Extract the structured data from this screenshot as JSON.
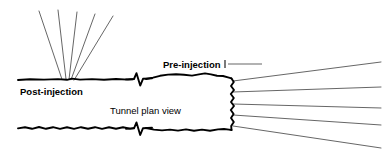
{
  "figure": {
    "title": "Tunnel plan view",
    "background_color": "#ffffff",
    "ink_color": "#000000",
    "bolt_color": "#555555",
    "leader_color": "#666666",
    "width": 387,
    "height": 154
  },
  "labels": {
    "post_injection": "Post-injection",
    "pre_injection": "Pre-injection",
    "plan_view": "Tunnel plan view"
  },
  "label_positions": {
    "post_injection": {
      "x": 20,
      "y": 95
    },
    "pre_injection": {
      "x": 163,
      "y": 68
    },
    "plan_view": {
      "x": 110,
      "y": 114
    }
  },
  "leader": {
    "tick_x": 225,
    "tick_y_top": 60,
    "tick_y_bottom": 68,
    "line_x_start": 228,
    "line_x_end": 262,
    "line_y": 64
  },
  "tunnel": {
    "top_wall_left": "M 18 80 L 30 79.2 L 44 79.6 L 58 79.1 L 67 79.8 L 72 78.6 L 80 79.6 L 92 79.1 L 104 79.7 L 116 79.0 L 128 79.6 L 133 79.2",
    "top_wall_right": "M 146 79.0 L 153 77.6 L 160 75.8 L 168 74.6 L 176 74.2 L 184 74.8 L 192 75.6 L 199 74.4 L 205 73.4 L 211 74.4 L 217 75.8 L 223 76.0 L 228 77.4 L 231.5 78.4",
    "bottom_wall_left": "M 18 128.4 L 25 127.2 L 32 128.8 L 39 127.0 L 46 128.8 L 53 127.2 L 60 128.9 L 67 127.3 L 74 128.9 L 81 127.2 L 88 128.8 L 95 127.2 L 102 128.9 L 109 127.3 L 116 128.8 L 123 127.3 L 130 128.6 L 134 128.0",
    "bottom_wall_right": "M 146 128.0 L 154 129.6 L 162 130.4 L 170 129.6 L 178 130.6 L 186 129.4 L 194 130.8 L 202 129.6 L 210 130.8 L 218 129.4 L 224 129.0 L 229 129.6 L 231.5 130.0",
    "face": "M 231.5 78.4 L 233.8 82 L 231.0 86 L 234.0 90 L 230.8 94 L 233.8 98 L 231.0 102 L 234.0 106 L 230.8 110 L 233.6 114 L 231.0 118 L 233.8 122 L 231.2 126 L 231.5 130.0",
    "break_top": "M 126 79.4 L 134 79.0 L 136.5 73.2 L 140.2 85.6 L 143.0 78.8 L 152 78.4",
    "break_bottom": "M 126 128.8 L 134 128.4 L 136.5 122.4 L 140.2 135.0 L 143.0 128.2 L 152 127.8"
  },
  "bolt_fans": {
    "post_injection": {
      "origin": {
        "x": 68,
        "y": 79
      },
      "description": "pre-grouted bolt fan projecting up from the completed tunnel wall",
      "count": 5,
      "tips": [
        {
          "x": 39,
          "y": 11
        },
        {
          "x": 58,
          "y": 10
        },
        {
          "x": 77,
          "y": 12
        },
        {
          "x": 95,
          "y": 14
        },
        {
          "x": 113,
          "y": 16
        }
      ],
      "roots": [
        {
          "x": 62,
          "y": 79.4
        },
        {
          "x": 66,
          "y": 79.0
        },
        {
          "x": 69,
          "y": 79.4
        },
        {
          "x": 71,
          "y": 79.8
        },
        {
          "x": 74,
          "y": 80.2
        }
      ]
    },
    "pre_injection": {
      "origin": {
        "x": 233,
        "y": 104
      },
      "description": "injection boreholes fanning forward from the tunnel face",
      "count": 5,
      "roots": [
        {
          "x": 233,
          "y": 81
        },
        {
          "x": 233,
          "y": 92
        },
        {
          "x": 233,
          "y": 104
        },
        {
          "x": 233,
          "y": 115
        },
        {
          "x": 233,
          "y": 126
        }
      ],
      "tips": [
        {
          "x": 381,
          "y": 62
        },
        {
          "x": 381,
          "y": 87
        },
        {
          "x": 381,
          "y": 108
        },
        {
          "x": 381,
          "y": 125
        },
        {
          "x": 381,
          "y": 148
        }
      ]
    }
  }
}
